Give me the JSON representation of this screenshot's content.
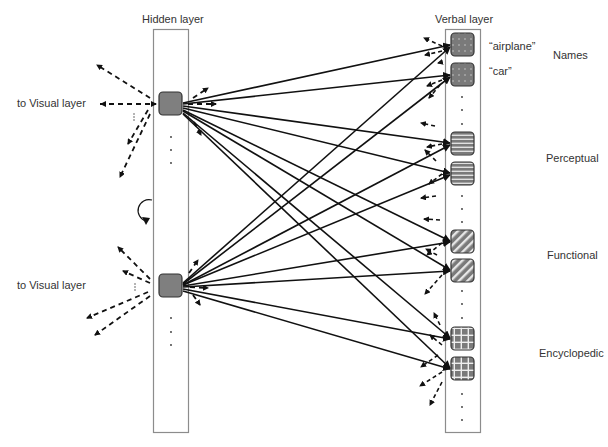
{
  "hidden_layer": {
    "title": "Hidden layer",
    "units": [
      {
        "id": "h1",
        "side_label": "to Visual layer"
      },
      {
        "id": "h2",
        "side_label": "to Visual layer"
      }
    ]
  },
  "verbal_layer": {
    "title": "Verbal layer",
    "groups": [
      {
        "name": "Names",
        "pattern": "dots",
        "units": [
          "“airplane”",
          "“car”"
        ]
      },
      {
        "name": "Perceptual",
        "pattern": "horizontal-stripes",
        "units": [
          "",
          ""
        ]
      },
      {
        "name": "Functional",
        "pattern": "diagonal-stripes",
        "units": [
          "",
          ""
        ]
      },
      {
        "name": "Encyclopedic",
        "pattern": "grid",
        "units": [
          "",
          ""
        ]
      }
    ]
  },
  "annotations": {
    "recurrent_icon": "circular-arrow-icon",
    "ellipsis": "⋮"
  },
  "colors": {
    "unit_fill": "#7f7f7f",
    "unit_border": "#333333",
    "column_border": "#8c8c8c",
    "arrow": "#111111"
  }
}
